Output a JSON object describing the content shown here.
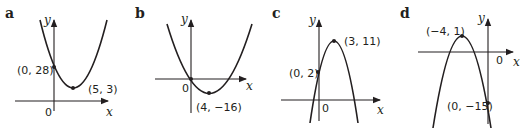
{
  "graphs": [
    {
      "part_label": "a",
      "axis_x": "x",
      "axis_y": "y",
      "origin_label": "0",
      "points": [
        {
          "label": "(0, 28)",
          "x": 0,
          "y": 28,
          "role": "y-intercept"
        },
        {
          "label": "(5, 3)",
          "x": 5,
          "y": 3,
          "role": "vertex"
        }
      ],
      "opens": "up"
    },
    {
      "part_label": "b",
      "axis_x": "x",
      "axis_y": "y",
      "origin_label": "0",
      "points": [
        {
          "label": "(4, −16)",
          "x": 4,
          "y": -16,
          "role": "vertex"
        }
      ],
      "opens": "up"
    },
    {
      "part_label": "c",
      "axis_x": "x",
      "axis_y": "y",
      "origin_label": "0",
      "points": [
        {
          "label": "(3, 11)",
          "x": 3,
          "y": 11,
          "role": "vertex"
        },
        {
          "label": "(0, 2)",
          "x": 0,
          "y": 2,
          "role": "y-intercept"
        }
      ],
      "opens": "down"
    },
    {
      "part_label": "d",
      "axis_x": "x",
      "axis_y": "y",
      "origin_label": "0",
      "points": [
        {
          "label": "(−4, 1)",
          "x": -4,
          "y": 1,
          "role": "vertex"
        },
        {
          "label": "(0, −15)",
          "x": 0,
          "y": -15,
          "role": "y-intercept"
        }
      ],
      "opens": "down"
    }
  ]
}
